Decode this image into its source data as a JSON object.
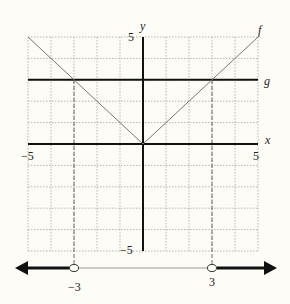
{
  "chart_data": {
    "type": "line",
    "title": "",
    "xlabel": "x",
    "ylabel": "y",
    "xlim": [
      -5,
      5
    ],
    "ylim": [
      -5,
      5
    ],
    "grid": true,
    "tick_labels": {
      "x_min": "−5",
      "x_max": "5",
      "y_min": "−5",
      "y_max": "5"
    },
    "series": [
      {
        "name": "f",
        "expression": "|x|",
        "x": [
          -5,
          0,
          5
        ],
        "y": [
          5,
          0,
          5
        ],
        "color": "#777777"
      },
      {
        "name": "g",
        "expression": "3",
        "x": [
          -5,
          5
        ],
        "y": [
          3,
          3
        ],
        "color": "#111111"
      }
    ],
    "intersections": [
      {
        "x": -3,
        "y": 3
      },
      {
        "x": 3,
        "y": 3
      }
    ],
    "number_line": {
      "open_points": [
        -3,
        3
      ],
      "labels": [
        "−3",
        "3"
      ],
      "shaded": "x < -3 or x > 3"
    }
  },
  "labels": {
    "f": "f",
    "g": "g",
    "x": "x",
    "y": "y",
    "x_min": "−5",
    "x_max": "5",
    "y_min": "−5",
    "y_max": "5",
    "nl_left": "−3",
    "nl_right": "3"
  }
}
